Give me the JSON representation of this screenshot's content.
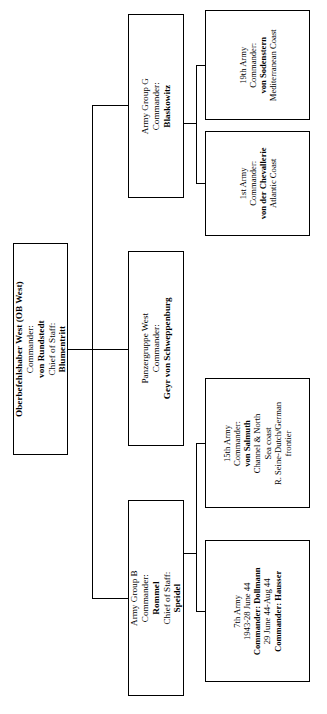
{
  "chart": {
    "type": "org-chart",
    "orientation": "rotated-90-ccw",
    "title": "",
    "nodes": [
      {
        "id": "ob-west",
        "name": "Oberbefehlshaber West (OB West)",
        "lines": [
          {
            "text": "Oberbefehlshaber West (OB West)",
            "bold": true
          },
          {
            "text": "Commander:",
            "bold": false
          },
          {
            "text": "von Rundstedt",
            "bold": true
          },
          {
            "text": "Chief of Staff:",
            "bold": false
          },
          {
            "text": "Blumentritt",
            "bold": true
          }
        ]
      },
      {
        "id": "army-group-g",
        "name": "Army Group G",
        "lines": [
          {
            "text": "Army Group G",
            "bold": false
          },
          {
            "text": "Commander:",
            "bold": false
          },
          {
            "text": "Blaskowitz",
            "bold": true
          }
        ]
      },
      {
        "id": "19th-army",
        "name": "19th Army",
        "lines": [
          {
            "text": "19th Army",
            "bold": false
          },
          {
            "text": "Commander:",
            "bold": false
          },
          {
            "text": "von Sodenstern",
            "bold": true
          },
          {
            "text": "Mediterranean Coast",
            "bold": false
          }
        ]
      },
      {
        "id": "1st-army",
        "name": "1st Army",
        "lines": [
          {
            "text": "1st Army",
            "bold": false
          },
          {
            "text": "Commander:",
            "bold": false
          },
          {
            "text": "von der Chevallerie",
            "bold": true
          },
          {
            "text": "Atlantic Coast",
            "bold": false
          }
        ]
      },
      {
        "id": "panzergruppe-west",
        "name": "Panzergruppe West",
        "lines": [
          {
            "text": "Panzergruppe West",
            "bold": false
          },
          {
            "text": "Commander:",
            "bold": false
          },
          {
            "text": "Geyr von Schweppenburg",
            "bold": true
          }
        ]
      },
      {
        "id": "army-group-b",
        "name": "Army Group B",
        "lines": [
          {
            "text": "Army Group B",
            "bold": false
          },
          {
            "text": "Commander:",
            "bold": false
          },
          {
            "text": "Rommel",
            "bold": true
          },
          {
            "text": "Chief of Staff:",
            "bold": false
          },
          {
            "text": "Speidel",
            "bold": true
          }
        ]
      },
      {
        "id": "15th-army",
        "name": "15th Army",
        "lines": [
          {
            "text": "15th Army",
            "bold": false
          },
          {
            "text": "Commander:",
            "bold": false
          },
          {
            "text": "von Salmuth",
            "bold": true
          },
          {
            "text": "Channel & North",
            "bold": false
          },
          {
            "text": "Sea coast",
            "bold": false
          },
          {
            "text": "R. Seine-Dutch/German",
            "bold": false
          },
          {
            "text": "frontier",
            "bold": false
          }
        ]
      },
      {
        "id": "7th-army",
        "name": "7th Army",
        "lines": [
          {
            "text": "7th Army",
            "bold": false
          },
          {
            "text": "1943-28 June 44",
            "bold": false
          },
          {
            "text": "Commander: Dollmann",
            "bold": true
          },
          {
            "text": "29 June 44-Aug 44",
            "bold": false
          },
          {
            "text": "Commander: Hausser",
            "bold": true
          }
        ]
      }
    ],
    "edges": [
      {
        "from": "ob-west",
        "to": "army-group-g"
      },
      {
        "from": "ob-west",
        "to": "panzergruppe-west"
      },
      {
        "from": "ob-west",
        "to": "army-group-b"
      },
      {
        "from": "army-group-g",
        "to": "19th-army"
      },
      {
        "from": "army-group-g",
        "to": "1st-army"
      },
      {
        "from": "army-group-b",
        "to": "15th-army"
      },
      {
        "from": "army-group-b",
        "to": "7th-army"
      }
    ]
  },
  "root": {
    "l1": "Oberbefehlshaber West (OB West)",
    "l2": "Commander:",
    "l3": "von Rundstedt",
    "l4": "Chief of Staff:",
    "l5": "Blumentritt"
  },
  "army_group_g": {
    "l1": "Army Group G",
    "l2": "Commander:",
    "l3": "Blaskowitz"
  },
  "army_19th": {
    "l1": "19th Army",
    "l2": "Commander:",
    "l3": "von Sodenstern",
    "l4": "Mediterranean Coast"
  },
  "army_1st": {
    "l1": "1st Army",
    "l2": "Commander:",
    "l3": "von der Chevallerie",
    "l4": "Atlantic Coast"
  },
  "panzergruppe_west": {
    "l1": "Panzergruppe West",
    "l2": "Commander:",
    "l3": "Geyr von Schweppenburg"
  },
  "army_group_b": {
    "l1": "Army Group B",
    "l2": "Commander:",
    "l3": "Rommel",
    "l4": "Chief of Staff:",
    "l5": "Speidel"
  },
  "army_15th": {
    "l1": "15th Army",
    "l2": "Commander:",
    "l3": "von Salmuth",
    "l4": "Channel & North",
    "l5": "Sea coast",
    "l6": "R. Seine-Dutch/German",
    "l7": "frontier"
  },
  "army_7th": {
    "l1": "7th Army",
    "l2": "1943-28 June 44",
    "l3": "Commander: Dollmann",
    "l4": "29 June 44-Aug 44",
    "l5": "Commander: Hausser"
  }
}
